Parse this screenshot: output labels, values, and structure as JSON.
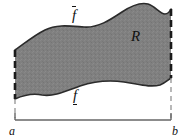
{
  "figure": {
    "labels": {
      "upper_function": "f",
      "lower_function": "f",
      "region": "R",
      "left_endpoint": "a",
      "right_endpoint": "b"
    },
    "colors": {
      "region_fill": "#808080",
      "region_stroke": "#2b2b2b",
      "dashed_line": "#1a1a1a",
      "dashed_line_light": "#8a8a8a",
      "baseline": "#666666",
      "text": "#111111",
      "background": "#ffffff"
    },
    "geometry": {
      "x_left": 15,
      "x_right": 171,
      "baseline_y": 120,
      "upper_curve": "M15,50 C24,44 33,36 45,30 C57,24 70,26 84,27 C98,28 110,20 122,12 C131,6 140,2 148,4 C155,6 160,14 165,14 C168,14 170,11 171,9",
      "lower_curve": "M15,99 C24,95 32,93 42,95 C54,97 66,91 80,86 C95,81 110,80 124,82 C138,84 150,88 160,85 C165,83 168,80 171,78"
    },
    "annotations": {
      "upper_bar": "overline",
      "lower_bar": "underline",
      "vertical_edges": "dashed",
      "baseline_ticks": "both-ends-up"
    }
  }
}
